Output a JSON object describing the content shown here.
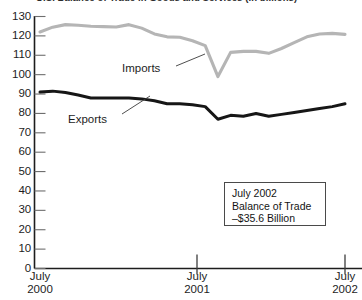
{
  "chart_data": {
    "type": "line",
    "title": "U.S. Balance of Trade in Goods and Services (in billions)",
    "xlabel": "",
    "ylabel": "",
    "ylim": [
      0,
      130
    ],
    "ytick_step": 10,
    "yticks": [
      130,
      120,
      110,
      100,
      90,
      80,
      70,
      60,
      50,
      40,
      30,
      20,
      10,
      0
    ],
    "grid": false,
    "legend_position": "inline-callout",
    "x_axis_ticks": [
      {
        "line1": "July",
        "line2": "2000"
      },
      {
        "line1": "July",
        "line2": "2001"
      },
      {
        "line1": "July",
        "line2": "2002"
      }
    ],
    "x": [
      "Jul 2000",
      "Aug 2000",
      "Sep 2000",
      "Oct 2000",
      "Nov 2000",
      "Dec 2000",
      "Jan 2001",
      "Feb 2001",
      "Mar 2001",
      "Apr 2001",
      "May 2001",
      "Jun 2001",
      "Jul 2001",
      "Aug 2001",
      "Sep 2001",
      "Oct 2001",
      "Nov 2001",
      "Dec 2001",
      "Jan 2002",
      "Feb 2002",
      "Mar 2002",
      "Apr 2002",
      "May 2002",
      "Jun 2002",
      "Jul 2002"
    ],
    "series": [
      {
        "name": "Imports",
        "color": "#b5b5b5",
        "values": [
          122.0,
          124.5,
          125.8,
          125.5,
          125.0,
          124.8,
          124.6,
          125.8,
          124.0,
          121.0,
          119.5,
          119.3,
          117.5,
          115.0,
          99.0,
          111.5,
          112.0,
          112.0,
          111.0,
          113.5,
          116.5,
          119.5,
          121.0,
          121.3,
          120.8
        ]
      },
      {
        "name": "Exports",
        "color": "#161616",
        "values": [
          91.0,
          91.5,
          90.8,
          89.5,
          88.0,
          88.0,
          88.0,
          88.0,
          87.5,
          86.5,
          85.0,
          85.0,
          84.5,
          83.5,
          77.0,
          79.0,
          78.5,
          80.0,
          78.5,
          79.5,
          80.5,
          81.5,
          82.5,
          83.5,
          85.0
        ]
      }
    ],
    "annotations": [
      {
        "name": "balance-of-trade-note",
        "lines": [
          "July 2002",
          "Balance of Trade",
          "–$35.6 Billion"
        ]
      }
    ]
  }
}
